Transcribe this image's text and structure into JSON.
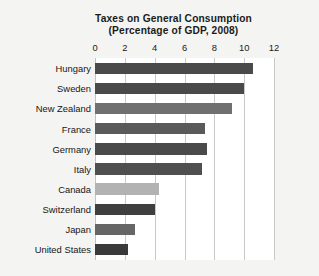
{
  "chart_data": {
    "type": "bar",
    "orientation": "horizontal",
    "title": "Taxes on General Consumption",
    "subtitle": "(Percentage of GDP, 2008)",
    "xlabel": "",
    "ylabel": "",
    "xlim": [
      0,
      12
    ],
    "xticks": [
      0,
      2,
      4,
      6,
      8,
      10,
      12
    ],
    "xtick_labels": [
      "0",
      "2",
      "4",
      "6",
      "8",
      "10",
      "12"
    ],
    "grid": "vertical",
    "legend": "none",
    "categories": [
      "Hungary",
      "Sweden",
      "New Zealand",
      "France",
      "Germany",
      "Italy",
      "Canada",
      "Switzerland",
      "Japan",
      "United States"
    ],
    "values": [
      10.6,
      10.0,
      9.2,
      7.4,
      7.5,
      7.2,
      4.3,
      4.0,
      2.7,
      2.2
    ],
    "bar_colors": [
      "#4a4a4a",
      "#4a4a4a",
      "#707070",
      "#5a5a5a",
      "#4a4a4a",
      "#4f4f4f",
      "#b2b2b2",
      "#3f3f3f",
      "#666666",
      "#3a3a3a"
    ]
  },
  "figure": {
    "background_color": "#f4f4f2",
    "plot_background_color": "#ffffff",
    "gridline_color": "#c9c9c9",
    "text_color": "#1b1b1b"
  }
}
